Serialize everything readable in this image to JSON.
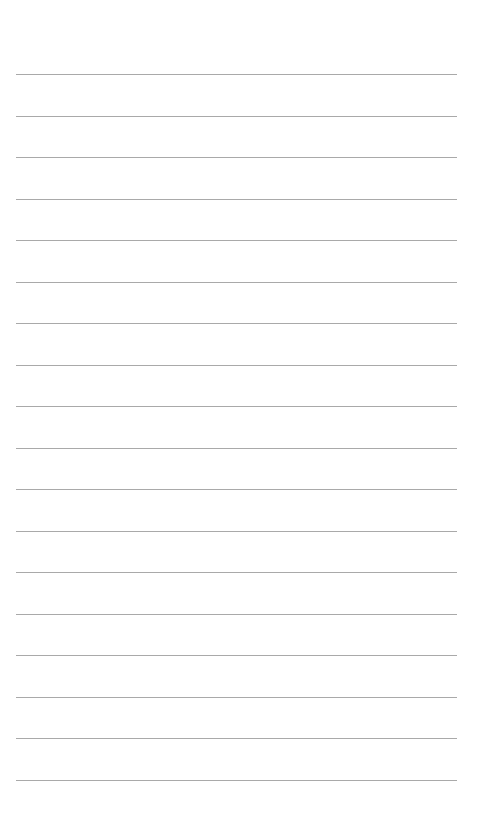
{
  "page": {
    "type": "lined-notepaper",
    "background_color": "#ffffff",
    "rule_color": "#9a9a9a",
    "rule_count": 18,
    "rule_left_px": 16,
    "rule_right_px": 457,
    "first_rule_y_px": 74,
    "rule_spacing_px": 41.5,
    "lines": [
      "",
      "",
      "",
      "",
      "",
      "",
      "",
      "",
      "",
      "",
      "",
      "",
      "",
      "",
      "",
      "",
      "",
      ""
    ]
  }
}
